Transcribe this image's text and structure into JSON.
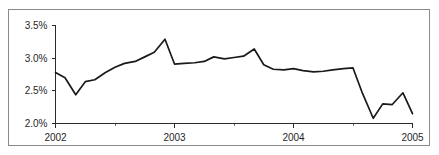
{
  "chart_data": {
    "type": "line",
    "title": "",
    "subtitle": "",
    "xlabel": "",
    "ylabel": "",
    "ylim": [
      2.0,
      3.5
    ],
    "xlim": [
      2002.0,
      2005.0
    ],
    "grid": false,
    "legend": null,
    "value_format": "percent",
    "y_ticks": [
      2.0,
      2.5,
      3.0,
      3.5
    ],
    "y_tick_labels": [
      "2.0%",
      "2.5%",
      "3.0%",
      "3.5%"
    ],
    "x_ticks": [
      2002,
      2003,
      2004,
      2005
    ],
    "x_tick_labels": [
      "2002",
      "2003",
      "2004",
      "2005"
    ],
    "series": [
      {
        "name": "rate",
        "color": "#1a1a1a",
        "x": [
          2002.0,
          2002.08,
          2002.17,
          2002.25,
          2002.33,
          2002.42,
          2002.5,
          2002.58,
          2002.67,
          2002.75,
          2002.83,
          2002.92,
          2003.0,
          2003.08,
          2003.17,
          2003.25,
          2003.33,
          2003.42,
          2003.5,
          2003.58,
          2003.67,
          2003.75,
          2003.83,
          2003.92,
          2004.0,
          2004.08,
          2004.17,
          2004.25,
          2004.33,
          2004.42,
          2004.5,
          2004.58,
          2004.67,
          2004.75,
          2004.83,
          2004.92,
          2005.0
        ],
        "values": [
          2.78,
          2.7,
          2.44,
          2.64,
          2.67,
          2.78,
          2.86,
          2.92,
          2.95,
          3.02,
          3.09,
          3.29,
          2.91,
          2.92,
          2.93,
          2.95,
          3.02,
          2.99,
          3.01,
          3.03,
          3.14,
          2.9,
          2.83,
          2.82,
          2.84,
          2.81,
          2.79,
          2.8,
          2.82,
          2.84,
          2.85,
          2.46,
          2.08,
          2.3,
          2.29,
          2.47,
          2.15
        ]
      }
    ],
    "annotations": []
  },
  "figure": {
    "border_color": "#8a8a8a",
    "background": "#ffffff",
    "line_color": "#1a1a1a",
    "axis_color": "#2b2b2b"
  }
}
